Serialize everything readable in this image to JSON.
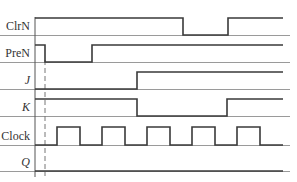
{
  "diagram": {
    "type": "timing-diagram",
    "x_start": 35,
    "x_end": 283,
    "baseline_end": 290,
    "axis": {
      "x": 35,
      "y_top": 17,
      "y_bottom": 177
    },
    "dashed_marker": {
      "x": 45,
      "y_top": 60,
      "y_bottom": 176
    },
    "signals": [
      {
        "name": "ClrN",
        "italic": false,
        "baseline_y": 35,
        "high": 17,
        "levels": [
          [
            35,
            1
          ],
          [
            183,
            0
          ],
          [
            228,
            1
          ]
        ]
      },
      {
        "name": "PreN",
        "italic": false,
        "baseline_y": 62,
        "high": 17,
        "levels": [
          [
            35,
            1
          ],
          [
            45,
            0
          ],
          [
            92,
            1
          ]
        ]
      },
      {
        "name": "J",
        "italic": true,
        "baseline_y": 89,
        "high": 17,
        "levels": [
          [
            35,
            0
          ],
          [
            137,
            1
          ]
        ]
      },
      {
        "name": "K",
        "italic": true,
        "baseline_y": 116,
        "high": 17,
        "levels": [
          [
            35,
            1
          ],
          [
            137,
            0
          ],
          [
            227,
            1
          ]
        ]
      },
      {
        "name": "Clock",
        "italic": false,
        "baseline_y": 145,
        "high": 18,
        "levels": [
          [
            35,
            0
          ],
          [
            57,
            1
          ],
          [
            80,
            0
          ],
          [
            102,
            1
          ],
          [
            125,
            0
          ],
          [
            147,
            1
          ],
          [
            170,
            0
          ],
          [
            192,
            1
          ],
          [
            215,
            0
          ],
          [
            237,
            1
          ],
          [
            260,
            0
          ]
        ]
      },
      {
        "name": "Q",
        "italic": true,
        "baseline_y": 171,
        "high": 17,
        "levels": [
          [
            35,
            0
          ]
        ]
      }
    ]
  }
}
